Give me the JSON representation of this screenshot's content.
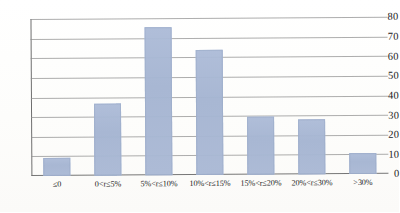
{
  "chart_data": {
    "type": "bar",
    "title": "",
    "subtitle": "",
    "xlabel": "",
    "ylabel": "",
    "categories": [
      "≤0",
      "0<r≤5%",
      "5%<r≤10%",
      "10%<r≤15%",
      "15%<r≤20%",
      "20%<r≤30%",
      ">30%"
    ],
    "values": [
      9,
      37,
      76,
      64,
      30,
      28,
      11
    ],
    "ylim": [
      0,
      80
    ],
    "y_ticks": [
      0,
      10,
      20,
      30,
      40,
      50,
      60,
      70,
      80
    ],
    "y_tick_labels": [
      "0",
      "10",
      "20",
      "30",
      "40",
      "50",
      "60",
      "70",
      "80"
    ],
    "grid": true,
    "legend": false,
    "legend_position": "none",
    "series": [
      {
        "name": "frequency",
        "values": [
          9,
          37,
          76,
          64,
          30,
          28,
          11
        ]
      }
    ],
    "bar_color": "#a9b9d6",
    "gridline_color": "#8d8d8d",
    "axis_color": "#6f6f6f",
    "background_color": "#fdfdfc"
  }
}
